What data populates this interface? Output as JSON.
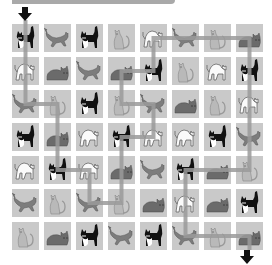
{
  "puzzle": {
    "banner": "",
    "rows": 7,
    "cols": 8,
    "cat_types": {
      "T": "tuxedo-cat-standing",
      "W": "gray-cat-walking",
      "S": "light-cat-sitting",
      "A": "white-cat-arched",
      "L": "dark-cat-lying"
    },
    "grid": [
      [
        "T",
        "W",
        "T",
        "S",
        "A",
        "W",
        "S",
        "L"
      ],
      [
        "A",
        "L",
        "W",
        "L",
        "T",
        "S",
        "A",
        "T"
      ],
      [
        "W",
        "S",
        "T",
        "S",
        "W",
        "L",
        "S",
        "A"
      ],
      [
        "T",
        "L",
        "A",
        "T",
        "A",
        "A",
        "T",
        "W"
      ],
      [
        "A",
        "T",
        "A",
        "L",
        "W",
        "T",
        "L",
        "S"
      ],
      [
        "W",
        "S",
        "W",
        "S",
        "L",
        "A",
        "L",
        "T"
      ],
      [
        "S",
        "L",
        "T",
        "W",
        "T",
        "W",
        "S",
        "L"
      ]
    ],
    "start_arrow": {
      "col": 0,
      "direction": "down",
      "icon": "arrow-down-icon"
    },
    "end_arrow": {
      "col": 7,
      "direction": "down",
      "icon": "arrow-down-icon"
    },
    "path": [
      [
        0,
        -1
      ],
      [
        0,
        2
      ],
      [
        1,
        2
      ],
      [
        1,
        4
      ],
      [
        2,
        4
      ],
      [
        2,
        5
      ],
      [
        3,
        5
      ],
      [
        3,
        3
      ],
      [
        4,
        3
      ],
      [
        4,
        2
      ],
      [
        3,
        2
      ],
      [
        3,
        1
      ],
      [
        4,
        1
      ],
      [
        4,
        0
      ],
      [
        7,
        0
      ],
      [
        7,
        4
      ],
      [
        5,
        4
      ],
      [
        5,
        6
      ],
      [
        7,
        6
      ],
      [
        7,
        7
      ]
    ],
    "colors": {
      "cell_bg": "#c9c9c9",
      "path": "#9a9a9a",
      "arrow": "#111111",
      "banner": "#a9a9a9"
    }
  }
}
